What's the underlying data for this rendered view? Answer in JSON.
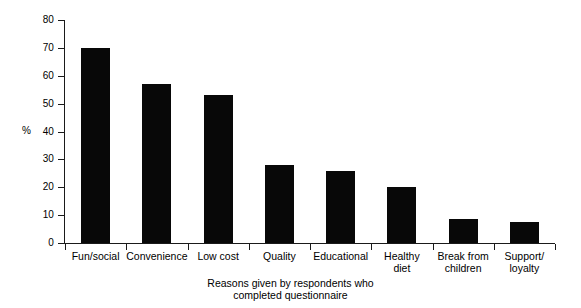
{
  "chart_data": {
    "type": "bar",
    "title": "",
    "subtitle": "",
    "xlabel": "Reasons given by respondents who\ncompleted questionnaire",
    "ylabel": "%",
    "categories": [
      "Fun/social",
      "Convenience",
      "Low cost",
      "Quality",
      "Educational",
      "Healthy\ndiet",
      "Break from\nchildren",
      "Support/\nloyalty"
    ],
    "values": [
      70,
      57,
      53,
      28,
      26,
      20,
      8.5,
      7.5
    ],
    "ylim": [
      0,
      80
    ],
    "yticks": [
      0,
      10,
      20,
      30,
      40,
      50,
      60,
      70,
      80
    ],
    "ytick_labels": [
      "0",
      "10",
      "20",
      "30",
      "40",
      "50",
      "60",
      "70",
      "80"
    ],
    "grid": false,
    "legend": false,
    "legend_position": "none",
    "bar_color": "#080808",
    "axis_color": "#1a1a1a",
    "background": "#ffffff"
  }
}
